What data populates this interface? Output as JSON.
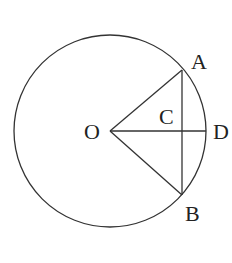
{
  "diagram": {
    "type": "geometry",
    "stroke_color": "#333333",
    "background": "#ffffff",
    "circle": {
      "center": "O",
      "cx": 110,
      "cy": 131,
      "r": 96
    },
    "points": {
      "O": {
        "label": "O",
        "x": 110,
        "y": 131
      },
      "A": {
        "label": "A",
        "x": 182,
        "y": 70
      },
      "B": {
        "label": "B",
        "x": 182,
        "y": 195
      },
      "C": {
        "label": "C",
        "x": 182,
        "y": 131
      },
      "D": {
        "label": "D",
        "x": 206,
        "y": 131
      }
    },
    "segments": [
      {
        "from": "O",
        "to": "A"
      },
      {
        "from": "O",
        "to": "B"
      },
      {
        "from": "O",
        "to": "D"
      },
      {
        "from": "A",
        "to": "B"
      }
    ],
    "labels": {
      "O": "O",
      "A": "A",
      "B": "B",
      "C": "C",
      "D": "D"
    }
  }
}
